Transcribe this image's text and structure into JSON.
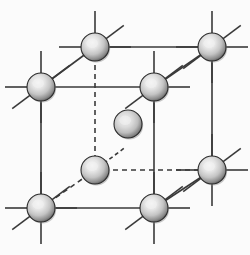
{
  "figure": {
    "background_color": "#fbfbfb",
    "line_color": "#3a3a3a",
    "dashed_color": "#3a3a3a",
    "sphere_highlight_color": "#f2f2f2",
    "sphere_mid_color": "#c2c2c2",
    "sphere_edge_color": "#4a4a4a",
    "sphere_outline_color": "#2b2b2b"
  },
  "geometry": {
    "sphere_radius": 14,
    "center_sphere_radius": 14,
    "line_width": 1.6,
    "dash_pattern": "5,4",
    "stub_length": 22
  },
  "atoms": [
    {
      "id": "front-top-left",
      "label": "Front top left corner atom",
      "x": 41,
      "y": 87,
      "r": 14,
      "hidden": false,
      "stubs": [
        "up",
        "down",
        "left",
        "diag-up-right",
        "diag-down-left"
      ]
    },
    {
      "id": "front-top-right",
      "label": "Front top right corner atom",
      "x": 154,
      "y": 87,
      "r": 14,
      "hidden": false,
      "stubs": [
        "up",
        "down",
        "right",
        "diag-up-right",
        "diag-down-left"
      ]
    },
    {
      "id": "front-bottom-left",
      "label": "Front bottom left corner atom",
      "x": 41,
      "y": 208,
      "r": 14,
      "hidden": false,
      "stubs": [
        "up",
        "down",
        "left",
        "right",
        "diag-up-right",
        "diag-down-left"
      ]
    },
    {
      "id": "front-bottom-right",
      "label": "Front bottom right corner atom",
      "x": 154,
      "y": 208,
      "r": 14,
      "hidden": false,
      "stubs": [
        "up",
        "down",
        "right",
        "diag-up-right",
        "diag-down-left"
      ]
    },
    {
      "id": "back-top-left",
      "label": "Back top left corner atom",
      "x": 95,
      "y": 47,
      "r": 14,
      "hidden": false,
      "stubs": [
        "up",
        "left",
        "right",
        "diag-up-right"
      ]
    },
    {
      "id": "back-top-right",
      "label": "Back top right corner atom",
      "x": 212,
      "y": 47,
      "r": 14,
      "hidden": false,
      "stubs": [
        "up",
        "down",
        "left",
        "right",
        "diag-up-right",
        "diag-down-left"
      ]
    },
    {
      "id": "back-bottom-left",
      "label": "Back bottom left hidden corner atom",
      "x": 95,
      "y": 170,
      "r": 14,
      "hidden": true,
      "stubs": [
        "diag-up-right-dashed"
      ]
    },
    {
      "id": "back-bottom-right",
      "label": "Back bottom right corner atom",
      "x": 212,
      "y": 170,
      "r": 14,
      "hidden": false,
      "stubs": [
        "up",
        "down",
        "left",
        "right",
        "diag-up-right",
        "diag-down-left"
      ]
    },
    {
      "id": "body-center",
      "label": "Body-center atom",
      "x": 128,
      "y": 124,
      "r": 14,
      "hidden": false,
      "stubs": []
    }
  ],
  "edges": [
    {
      "id": "front-top",
      "label": "Front top edge",
      "from": "front-top-left",
      "to": "front-top-right",
      "style": "solid"
    },
    {
      "id": "front-left",
      "label": "Front left edge",
      "from": "front-top-left",
      "to": "front-bottom-left",
      "style": "solid"
    },
    {
      "id": "front-right",
      "label": "Front right edge",
      "from": "front-top-right",
      "to": "front-bottom-right",
      "style": "solid"
    },
    {
      "id": "front-bottom",
      "label": "Front bottom edge",
      "from": "front-bottom-left",
      "to": "front-bottom-right",
      "style": "solid"
    },
    {
      "id": "back-top",
      "label": "Back top edge",
      "from": "back-top-left",
      "to": "back-top-right",
      "style": "solid"
    },
    {
      "id": "back-right",
      "label": "Back right edge",
      "from": "back-top-right",
      "to": "back-bottom-right",
      "style": "solid"
    },
    {
      "id": "back-bottom",
      "label": "Back bottom hidden edge",
      "from": "back-bottom-left",
      "to": "back-bottom-right",
      "style": "dashed"
    },
    {
      "id": "back-left",
      "label": "Back left hidden edge",
      "from": "back-top-left",
      "to": "back-bottom-left",
      "style": "dashed"
    },
    {
      "id": "depth-top-left",
      "label": "Top left depth edge",
      "from": "front-top-left",
      "to": "back-top-left",
      "style": "solid"
    },
    {
      "id": "depth-top-right",
      "label": "Top right depth edge",
      "from": "front-top-right",
      "to": "back-top-right",
      "style": "solid"
    },
    {
      "id": "depth-bottom-right",
      "label": "Bottom right depth edge",
      "from": "front-bottom-right",
      "to": "back-bottom-right",
      "style": "solid"
    },
    {
      "id": "depth-bottom-left",
      "label": "Bottom left hidden depth edge",
      "from": "front-bottom-left",
      "to": "back-bottom-left",
      "style": "dashed"
    }
  ]
}
